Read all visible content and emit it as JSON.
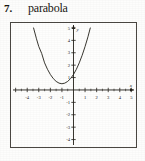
{
  "header": {
    "problem_number": "7.",
    "title": "parabola"
  },
  "chart_data": {
    "type": "line",
    "title": "parabola",
    "xlabel": "x",
    "ylabel": "y",
    "grid": false,
    "legend": null,
    "xlim": [
      -5.4,
      5.4
    ],
    "ylim": [
      -4.6,
      5.4
    ],
    "xticks": [
      -5,
      -4,
      -3,
      -2,
      -1,
      1,
      2,
      3,
      4,
      5
    ],
    "yticks": [
      -4,
      -3,
      -2,
      -1,
      1,
      2,
      3,
      4,
      5
    ],
    "xtick_labels": [
      "",
      "-4",
      "-3",
      "-2",
      "-1",
      "1",
      "2",
      "3",
      "4",
      "5"
    ],
    "ytick_labels": [
      "-4",
      "-3",
      "-2",
      "-1",
      "1",
      "2",
      "3",
      "4",
      "5"
    ],
    "curve": {
      "name": "parabola",
      "equation": "y = (x + 1)^2 * 0.75 + 0.5",
      "vertex": [
        -1,
        0.5
      ],
      "opens": "up",
      "y_intercept": 1.25,
      "x": [
        -3.45,
        -3.2,
        -3.0,
        -2.75,
        -2.5,
        -2.25,
        -2.0,
        -1.75,
        -1.5,
        -1.25,
        -1.0,
        -0.75,
        -0.5,
        -0.25,
        0.0,
        0.25,
        0.5,
        0.75,
        1.0,
        1.25,
        1.45
      ],
      "y": [
        5.0,
        4.13,
        3.5,
        2.95,
        2.19,
        1.67,
        1.25,
        0.92,
        0.69,
        0.55,
        0.5,
        0.55,
        0.69,
        0.92,
        1.25,
        1.67,
        2.19,
        2.8,
        3.5,
        4.29,
        5.0
      ]
    }
  },
  "axis_labels": {
    "x_axis_name": "x",
    "y_axis_name": "y"
  }
}
